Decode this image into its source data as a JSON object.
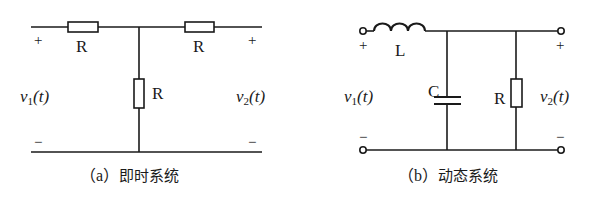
{
  "figure": {
    "stroke_color": "#1a1a1a",
    "background": "#ffffff"
  },
  "circuit_a": {
    "caption_tag": "（a）",
    "caption_text": "即时系统",
    "input_label_var": "v",
    "input_label_sub": "1",
    "input_label_arg": "(t)",
    "output_label_var": "v",
    "output_label_sub": "2",
    "output_label_arg": "(t)",
    "plus_sign": "+",
    "minus_sign": "−",
    "components": [
      {
        "type": "resistor",
        "label": "R",
        "position": "series-left"
      },
      {
        "type": "resistor",
        "label": "R",
        "position": "series-right"
      },
      {
        "type": "resistor",
        "label": "R",
        "position": "shunt"
      }
    ]
  },
  "circuit_b": {
    "caption_tag": "（b）",
    "caption_text": "动态系统",
    "input_label_var": "v",
    "input_label_sub": "1",
    "input_label_arg": "(t)",
    "output_label_var": "v",
    "output_label_sub": "2",
    "output_label_arg": "(t)",
    "plus_sign": "+",
    "minus_sign": "−",
    "components": [
      {
        "type": "inductor",
        "label": "L",
        "position": "series"
      },
      {
        "type": "capacitor",
        "label": "C",
        "position": "shunt"
      },
      {
        "type": "resistor",
        "label": "R",
        "position": "shunt"
      }
    ]
  }
}
